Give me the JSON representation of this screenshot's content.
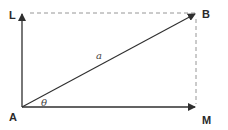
{
  "diagram": {
    "type": "vector-components",
    "colors": {
      "line": "#2f2f2f",
      "dashed": "#8a8a8a",
      "label": "#2a2a2a",
      "background": "#ffffff"
    },
    "points": {
      "A": {
        "label": "A",
        "x": 22,
        "y": 107
      },
      "L": {
        "label": "L",
        "x": 22,
        "y": 13
      },
      "B": {
        "label": "B",
        "x": 196,
        "y": 13
      },
      "M": {
        "label": "M",
        "x": 196,
        "y": 107
      }
    },
    "vectors": [
      {
        "from": "A",
        "to": "B",
        "label": "a"
      },
      {
        "from": "A",
        "to": "L",
        "label": ""
      },
      {
        "from": "A",
        "to": "M",
        "label": ""
      }
    ],
    "dashed_lines": [
      {
        "from": "L",
        "to": "B"
      },
      {
        "from": "B",
        "to": "M"
      }
    ],
    "angle": {
      "label": "θ",
      "vertex": "A",
      "between": [
        "AM",
        "AB"
      ]
    },
    "labels": {
      "A": "A",
      "B": "B",
      "L": "L",
      "M": "M",
      "vector_a": "a",
      "theta": "θ"
    }
  }
}
